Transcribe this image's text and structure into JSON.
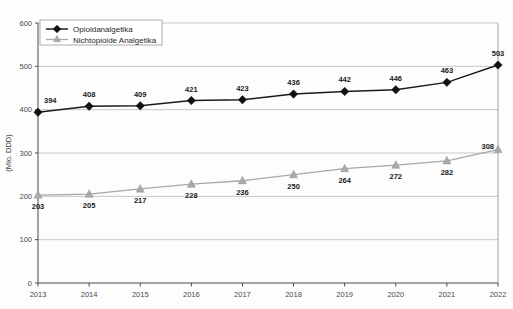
{
  "chart_data": {
    "type": "line",
    "title": "",
    "subtitle": "",
    "xlabel": "",
    "ylabel": "(Mio. DDD)",
    "categories": [
      "2013",
      "2014",
      "2015",
      "2016",
      "2017",
      "2018",
      "2019",
      "2020",
      "2021",
      "2022"
    ],
    "x": [
      2013,
      2014,
      2015,
      2016,
      2017,
      2018,
      2019,
      2020,
      2021,
      2022
    ],
    "ylim": [
      0,
      600
    ],
    "ytick_values": [
      0,
      100,
      200,
      300,
      400,
      500,
      600
    ],
    "ytick_labels": [
      "0",
      "100",
      "200",
      "300",
      "400",
      "500",
      "600"
    ],
    "grid": true,
    "grid_axis": "y",
    "legend_position": "upper left",
    "series": [
      {
        "name": "Opioidanalgetika",
        "marker": "diamond",
        "color": "#111111",
        "values": [
          394,
          408,
          409,
          421,
          423,
          436,
          442,
          446,
          463,
          503
        ],
        "labels": [
          "394",
          "408",
          "409",
          "421",
          "423",
          "436",
          "442",
          "446",
          "463",
          "503"
        ],
        "label_position": "above"
      },
      {
        "name": "Nichtopioide Analgetika",
        "marker": "triangle",
        "color": "#a9a9a9",
        "values": [
          203,
          205,
          217,
          228,
          236,
          250,
          264,
          272,
          282,
          308
        ],
        "labels": [
          "203",
          "205",
          "217",
          "228",
          "236",
          "250",
          "264",
          "272",
          "282",
          "308"
        ],
        "label_position": "below"
      }
    ]
  },
  "legend": {
    "entries": [
      {
        "label": "Opioidanalgetika",
        "marker": "diamond-marker",
        "color": "#111111"
      },
      {
        "label": "Nichtopioide Analgetika",
        "marker": "triangle-marker",
        "color": "#a9a9a9"
      }
    ]
  },
  "colors": {
    "primary_series": "#111111",
    "secondary_series": "#a9a9a9",
    "gridline": "#b9b9b9",
    "axis": "#4a4a4a",
    "background": "#fdfdfd"
  }
}
